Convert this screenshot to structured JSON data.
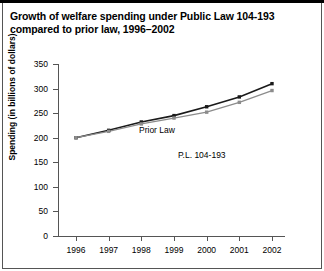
{
  "title": "Growth of welfare spending under Public Law 104-193 compared to prior law, 1996–2002",
  "chart_data": {
    "type": "line",
    "title": "Growth of welfare spending under Public Law 104-193 compared to prior law, 1996–2002",
    "xlabel": "",
    "ylabel": "Spending (in billions of dollars)",
    "categories": [
      "1996",
      "1997",
      "1998",
      "1999",
      "2000",
      "2001",
      "2002"
    ],
    "x": [
      1996,
      1997,
      1998,
      1999,
      2000,
      2001,
      2002
    ],
    "ylim": [
      0,
      350
    ],
    "yticks": [
      0,
      50,
      100,
      150,
      200,
      250,
      300,
      350
    ],
    "ytick_labels": [
      "0",
      "50",
      "100",
      "150",
      "200",
      "250",
      "300",
      "350"
    ],
    "grid": false,
    "legend_position": "inline-annotation",
    "series": [
      {
        "name": "Prior Law",
        "color": "#1a1a1a",
        "marker": "square",
        "values": [
          200,
          215,
          232,
          245,
          263,
          283,
          310
        ]
      },
      {
        "name": "P.L. 104-193",
        "color": "#8c8c8c",
        "marker": "square",
        "values": [
          200,
          213,
          228,
          240,
          252,
          272,
          296
        ]
      }
    ],
    "annotations": [
      {
        "text": "Prior Law",
        "series": "Prior Law"
      },
      {
        "text": "P.L. 104-193",
        "series": "P.L. 104-193"
      }
    ]
  },
  "colors": {
    "prior_law": "#1a1a1a",
    "pl_104_193": "#8c8c8c",
    "axis": "#555555",
    "text": "#000000",
    "background": "#ffffff"
  }
}
